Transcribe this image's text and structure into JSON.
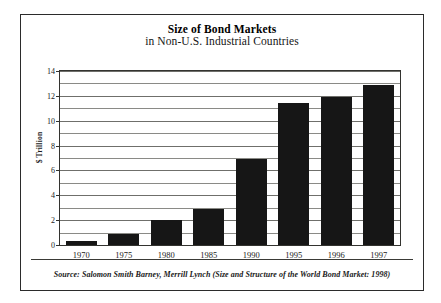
{
  "chart_data": {
    "type": "bar",
    "title": "Size of Bond Markets",
    "subtitle": "in Non-U.S. Industrial Countries",
    "xlabel": "",
    "ylabel": "$ Trillion",
    "categories": [
      "1970",
      "1975",
      "1980",
      "1985",
      "1990",
      "1995",
      "1996",
      "1997"
    ],
    "values": [
      0.35,
      0.85,
      2.0,
      2.9,
      6.9,
      11.4,
      11.9,
      12.9
    ],
    "series": [
      {
        "name": "Size of Bond Markets",
        "values": [
          0.35,
          0.85,
          2.0,
          2.9,
          6.9,
          11.4,
          11.9,
          12.9
        ]
      }
    ],
    "ylim": [
      0,
      14
    ],
    "ytick_labels": [
      "0",
      "2",
      "4",
      "6",
      "8",
      "10",
      "12",
      "14"
    ],
    "ytick_values": [
      0,
      2,
      4,
      6,
      8,
      10,
      12,
      14
    ],
    "gridline_values": [
      1,
      2,
      3,
      4,
      5,
      6,
      7,
      8,
      9,
      10,
      11,
      12,
      13,
      14
    ],
    "grid": true,
    "legend": false,
    "legend_position": "none",
    "bar_color": "#161616",
    "source_note": "Source: Salomon Smith Barney, Merrill Lynch (Size and Structure of the World Bond Market: 1998)"
  },
  "colors": {
    "frame": "#2b2b2b",
    "plot_border": "#33332f",
    "gridline": "#8a8a86",
    "bar": "#161616",
    "text": "#1a1a1a"
  }
}
